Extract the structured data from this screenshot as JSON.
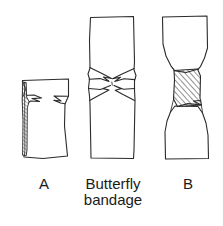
{
  "figure": {
    "background_color": "#ffffff",
    "ink_color": "#2b2b2b",
    "text_color": "#1a1a1a",
    "width": 223,
    "height": 226,
    "panels": [
      {
        "id": "panel-a",
        "label": "A",
        "description": "Open wound with raised skin flap",
        "bounds": {
          "x": 17,
          "y": 78,
          "w": 54,
          "h": 82
        }
      },
      {
        "id": "panel-middle",
        "label_line_1": "Butterfly",
        "label_line_2": "bandage",
        "description": "Butterfly bandage shape, narrow waist with flared ends",
        "bounds": {
          "x": 88,
          "y": 15,
          "w": 48,
          "h": 145
        }
      },
      {
        "id": "panel-b",
        "label": "B",
        "description": "Wound closed with butterfly bandage applied across, hatched",
        "bounds": {
          "x": 156,
          "y": 15,
          "w": 54,
          "h": 145
        }
      }
    ]
  },
  "captions": {
    "a": "A",
    "butterfly_line1": "Butterfly",
    "butterfly_line2": "bandage",
    "b": "B"
  }
}
